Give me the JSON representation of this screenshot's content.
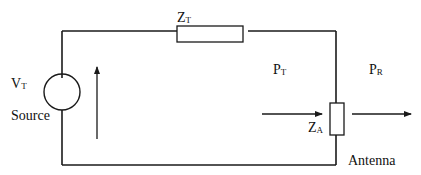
{
  "diagram": {
    "type": "antenna-equivalent-circuit",
    "labels": {
      "source_voltage": {
        "main": "V",
        "sub": "T"
      },
      "source_name": "Source",
      "transmitter_impedance": {
        "main": "Z",
        "sub": "T"
      },
      "antenna_impedance": {
        "main": "Z",
        "sub": "A"
      },
      "transmitted_power": {
        "main": "P",
        "sub": "T"
      },
      "radiated_power": {
        "main": "P",
        "sub": "R"
      },
      "antenna_name": "Antenna"
    },
    "components": [
      {
        "id": "voltage-source",
        "kind": "ac-source",
        "label": "VT"
      },
      {
        "id": "transmitter-impedance",
        "kind": "resistor",
        "label": "ZT"
      },
      {
        "id": "antenna-impedance",
        "kind": "resistor",
        "label": "ZA"
      }
    ],
    "arrows": [
      {
        "id": "current-arrow",
        "direction": "up"
      },
      {
        "id": "pt-arrow",
        "direction": "right",
        "label": "PT"
      },
      {
        "id": "pr-arrow",
        "direction": "right",
        "label": "PR"
      }
    ],
    "colors": {
      "stroke": "#1a1a1a",
      "background": "#ffffff"
    }
  }
}
